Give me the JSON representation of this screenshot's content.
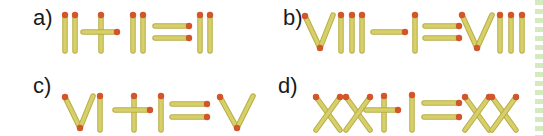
{
  "colors": {
    "match_body": "#d6cf6a",
    "match_edge": "#b8ae45",
    "match_head": "#d2552c",
    "label": "#1a1a1a",
    "border_dash": "#cfe8b8"
  },
  "puzzles": [
    {
      "label": "a)",
      "equation": "II+II=II"
    },
    {
      "label": "b)",
      "equation": "VIII−I=VIII"
    },
    {
      "label": "c)",
      "equation": "VI+I=V"
    },
    {
      "label": "d)",
      "equation": "XX+I=XX"
    }
  ]
}
